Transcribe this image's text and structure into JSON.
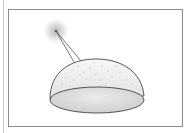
{
  "figure": {
    "elements": [
      "light-source",
      "light-rays",
      "dome",
      "dome-opening"
    ]
  },
  "colors": {
    "frame": "#8a8a8a",
    "glow": "#bdbdbd",
    "outline": "#444444",
    "dome_fill": "#efefef",
    "opening_fill": "#d8d8d8"
  }
}
